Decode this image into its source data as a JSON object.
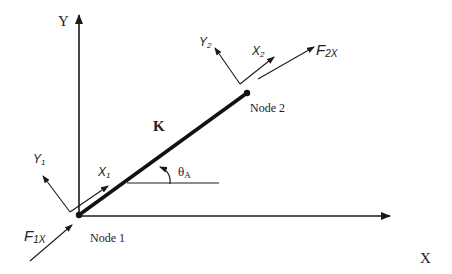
{
  "diagram": {
    "type": "truss-element-free-body",
    "global_axes": {
      "x_label": "X",
      "y_label": "Y"
    },
    "element": {
      "label": "K",
      "angle_label": "θ",
      "angle_sub": "A"
    },
    "node1": {
      "label": "Node 1",
      "local_x": "X",
      "local_x_sub": "1",
      "local_y": "Y",
      "local_y_sub": "1",
      "force": "F",
      "force_sub": "1X"
    },
    "node2": {
      "label": "Node 2",
      "local_x": "X",
      "local_x_sub": "2",
      "local_y": "Y",
      "local_y_sub": "2",
      "force": "F",
      "force_sub": "2X"
    },
    "colors": {
      "line": "#1a1a1a",
      "background": "#ffffff"
    }
  }
}
